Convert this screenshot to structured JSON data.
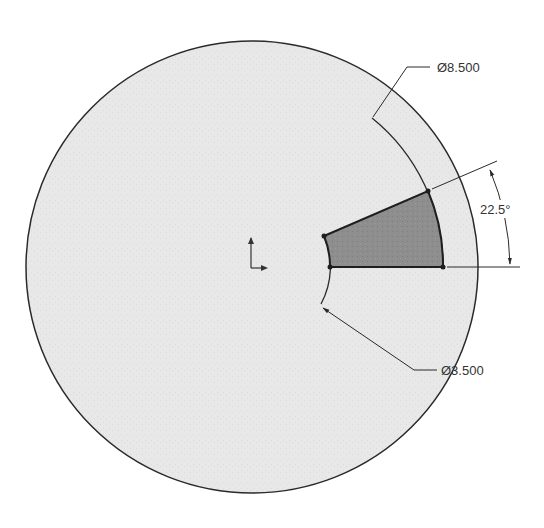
{
  "drawing": {
    "type": "CAD sketch",
    "background": "#ffffff",
    "disk_fill": "#e6e6e6",
    "sector_fill": "#8c8c8c",
    "line_color": "#2a2a2a",
    "center": {
      "x": 252,
      "y": 267
    },
    "outer_circle_radius": 226,
    "sector": {
      "inner_radius": 78,
      "outer_radius": 191,
      "start_angle_deg": 0,
      "sweep_angle_deg": 22.5
    }
  },
  "dimensions": {
    "outer_diameter": {
      "symbol": "Ø",
      "value": "8.500",
      "label": "Ø8.500"
    },
    "inner_diameter": {
      "symbol": "Ø",
      "value": "3.500",
      "label": "Ø3.500"
    },
    "angle": {
      "value": "22.5",
      "unit": "°",
      "label": "22.5°"
    }
  },
  "origin_marker": {
    "icon": "coordinate-axes-icon"
  }
}
